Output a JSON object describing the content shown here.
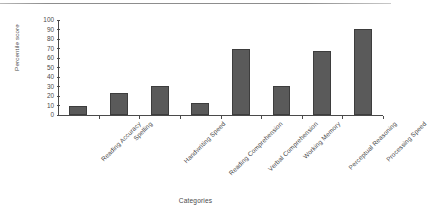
{
  "chart_data": {
    "type": "bar",
    "title": "",
    "xlabel": "Categories",
    "ylabel": "Percentile score",
    "categories": [
      "Reading Accuracy",
      "Spelling",
      "Handwriting Speed",
      "Reading Comprehension",
      "Verbal Comprehension",
      "Working Memory",
      "Perceptual Reasoning",
      "Processing Speed"
    ],
    "values": [
      9,
      23,
      31,
      13,
      69,
      31,
      67,
      91
    ],
    "ylim": [
      0,
      100
    ],
    "yticks": [
      0,
      10,
      20,
      30,
      40,
      50,
      60,
      70,
      80,
      90,
      100
    ],
    "ytick_labels": [
      "0",
      "10",
      "20",
      "30",
      "40",
      "50",
      "60",
      "70",
      "80",
      "90",
      "100"
    ],
    "grid": false,
    "legend": null,
    "bar_color": "#5a5a5a",
    "bar_edge_color": "#3d3d3d",
    "axis_color": "#4a4a4a",
    "background": "#ffffff",
    "xtick_label_rotation": -45
  }
}
